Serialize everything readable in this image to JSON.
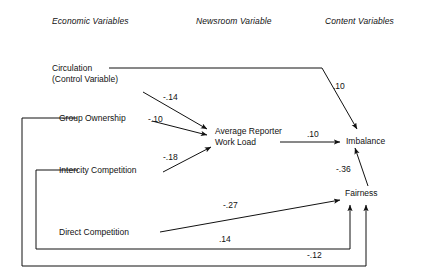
{
  "figure": {
    "type": "path-diagram",
    "background": "#ffffff",
    "line_color": "#111111"
  },
  "columns": [
    {
      "id": "economic",
      "label": "Economic Variables"
    },
    {
      "id": "newsroom",
      "label": "Newsroom Variable"
    },
    {
      "id": "content",
      "label": "Content Variables"
    }
  ],
  "nodes": [
    {
      "id": "circulation",
      "line1": "Circulation",
      "line2": "(Control Variable)",
      "column": "economic"
    },
    {
      "id": "group-ownership",
      "line1": "Group Ownership",
      "line2": "",
      "column": "economic"
    },
    {
      "id": "intercity-competition",
      "line1": "Intercity Competition",
      "line2": "",
      "column": "economic"
    },
    {
      "id": "direct-competition",
      "line1": "Direct Competition",
      "line2": "",
      "column": "economic"
    },
    {
      "id": "work-load",
      "line1": "Average Reporter",
      "line2": "Work Load",
      "column": "newsroom"
    },
    {
      "id": "imbalance",
      "line1": "Imbalance",
      "line2": "",
      "column": "content"
    },
    {
      "id": "fairness",
      "line1": "Fairness",
      "line2": "",
      "column": "content"
    }
  ],
  "paths": [
    {
      "id": "circulation-imbalance",
      "from": "circulation",
      "to": "imbalance",
      "coefficient": ".10"
    },
    {
      "id": "circulation-workload",
      "from": "circulation",
      "to": "work-load",
      "coefficient": "-.14"
    },
    {
      "id": "group-ownership-workload",
      "from": "group-ownership",
      "to": "work-load",
      "coefficient": "-.10"
    },
    {
      "id": "intercity-competition-workload",
      "from": "intercity-competition",
      "to": "work-load",
      "coefficient": "-.18"
    },
    {
      "id": "workload-imbalance",
      "from": "work-load",
      "to": "imbalance",
      "coefficient": ".10"
    },
    {
      "id": "fairness-imbalance",
      "from": "fairness",
      "to": "imbalance",
      "coefficient": "-.36"
    },
    {
      "id": "direct-competition-fairness",
      "from": "direct-competition",
      "to": "fairness",
      "coefficient": "-.27"
    },
    {
      "id": "intercity-competition-fairness",
      "from": "intercity-competition",
      "to": "fairness",
      "coefficient": ".14"
    },
    {
      "id": "group-ownership-fairness",
      "from": "group-ownership",
      "to": "fairness",
      "coefficient": "-.12"
    }
  ]
}
